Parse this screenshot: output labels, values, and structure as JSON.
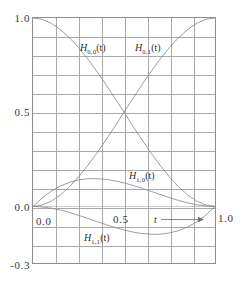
{
  "chart_data": {
    "type": "line",
    "title": "",
    "xlabel": "t",
    "ylabel": "",
    "xlim": [
      0.0,
      1.0
    ],
    "ylim": [
      -0.3,
      1.0
    ],
    "grid": true,
    "grid_x_step": 0.125,
    "grid_y_step": 0.1,
    "legend_position": "inline-annotations",
    "x_tick_labels": [
      "0.0",
      "0.5",
      "1.0"
    ],
    "x_tick_values": [
      0.0,
      0.5,
      1.0
    ],
    "y_tick_labels": [
      "1.0",
      "0.5",
      "0.0",
      "-0.3"
    ],
    "y_tick_values": [
      1.0,
      0.5,
      0.0,
      -0.3
    ],
    "axis_arrow_label": "t",
    "series": [
      {
        "name": "H_{0,0}(t)",
        "label_base": "H",
        "label_sub": "0,0",
        "label_arg": "(t)",
        "formula": "2t^3 - 3t^2 + 1",
        "x": [
          0.0,
          0.05,
          0.1,
          0.15,
          0.2,
          0.25,
          0.3,
          0.35,
          0.4,
          0.45,
          0.5,
          0.55,
          0.6,
          0.65,
          0.7,
          0.75,
          0.8,
          0.85,
          0.9,
          0.95,
          1.0
        ],
        "values": [
          1.0,
          0.9928,
          0.972,
          0.9393,
          0.896,
          0.8438,
          0.784,
          0.7183,
          0.648,
          0.5748,
          0.5,
          0.4253,
          0.352,
          0.2818,
          0.216,
          0.1563,
          0.104,
          0.0608,
          0.028,
          0.0073,
          0.0
        ]
      },
      {
        "name": "H_{0,1}(t)",
        "label_base": "H",
        "label_sub": "0,1",
        "label_arg": "(t)",
        "formula": "-2t^3 + 3t^2",
        "x": [
          0.0,
          0.05,
          0.1,
          0.15,
          0.2,
          0.25,
          0.3,
          0.35,
          0.4,
          0.45,
          0.5,
          0.55,
          0.6,
          0.65,
          0.7,
          0.75,
          0.8,
          0.85,
          0.9,
          0.95,
          1.0
        ],
        "values": [
          0.0,
          0.0073,
          0.028,
          0.0608,
          0.104,
          0.1563,
          0.216,
          0.2818,
          0.352,
          0.4253,
          0.5,
          0.5748,
          0.648,
          0.7183,
          0.784,
          0.8438,
          0.896,
          0.9393,
          0.972,
          0.9928,
          1.0
        ]
      },
      {
        "name": "H_{1,0}(t)",
        "label_base": "H",
        "label_sub": "1,0",
        "label_arg": "(t)",
        "formula": "t^3 - 2t^2 + t",
        "x": [
          0.0,
          0.05,
          0.1,
          0.15,
          0.2,
          0.25,
          0.3,
          0.3333,
          0.4,
          0.45,
          0.5,
          0.55,
          0.6,
          0.65,
          0.7,
          0.75,
          0.8,
          0.85,
          0.9,
          0.95,
          1.0
        ],
        "values": [
          0.0,
          0.0451,
          0.081,
          0.1084,
          0.128,
          0.1406,
          0.147,
          0.1481,
          0.144,
          0.1361,
          0.125,
          0.1114,
          0.096,
          0.0796,
          0.063,
          0.0469,
          0.032,
          0.0191,
          0.009,
          0.0024,
          0.0
        ]
      },
      {
        "name": "H_{1,1}(t)",
        "label_base": "H",
        "label_sub": "1,1",
        "label_arg": "(t)",
        "formula": "t^3 - t^2",
        "x": [
          0.0,
          0.05,
          0.1,
          0.15,
          0.2,
          0.25,
          0.3,
          0.35,
          0.4,
          0.45,
          0.5,
          0.55,
          0.6,
          0.6667,
          0.7,
          0.75,
          0.8,
          0.85,
          0.9,
          0.95,
          1.0
        ],
        "values": [
          0.0,
          -0.0024,
          -0.009,
          -0.0191,
          -0.032,
          -0.0469,
          -0.063,
          -0.0796,
          -0.096,
          -0.1114,
          -0.125,
          -0.1361,
          -0.144,
          -0.1481,
          -0.147,
          -0.1406,
          -0.128,
          -0.1084,
          -0.081,
          -0.0451,
          0.0
        ]
      }
    ],
    "annotations": [
      {
        "text": "H_{0,0}(t)",
        "x": 0.33,
        "y": 0.86
      },
      {
        "text": "H_{0,1}(t)",
        "x": 0.62,
        "y": 0.86
      },
      {
        "text": "H_{1,0}(t)",
        "x": 0.6,
        "y": 0.17
      },
      {
        "text": "H_{1,1}(t)",
        "x": 0.35,
        "y": -0.2
      }
    ],
    "colors": {
      "curve": "#8a8a8a",
      "grid": "#a8a8a8",
      "frame": "#8e8e8e",
      "text": "#2e2e2e",
      "background": "#ffffff"
    }
  },
  "axis": {
    "y_ticks": [
      {
        "label": "1.0",
        "value": 1.0
      },
      {
        "label": "0.5",
        "value": 0.5
      },
      {
        "label": "0.0",
        "value": 0.0
      },
      {
        "label": "-0.3",
        "value": -0.3
      }
    ],
    "x_ticks": [
      {
        "label": "0.0",
        "value": 0.0
      },
      {
        "label": "0.5",
        "value": 0.5
      },
      {
        "label": "1.0",
        "value": 1.0
      }
    ],
    "variable_label": "t"
  },
  "curve_labels": {
    "h00": {
      "base": "H",
      "sub": "0,0",
      "arg": "(t)"
    },
    "h01": {
      "base": "H",
      "sub": "0,1",
      "arg": "(t)"
    },
    "h10": {
      "base": "H",
      "sub": "1,0",
      "arg": "(t)"
    },
    "h11": {
      "base": "H",
      "sub": "1,1",
      "arg": "(t)"
    }
  }
}
